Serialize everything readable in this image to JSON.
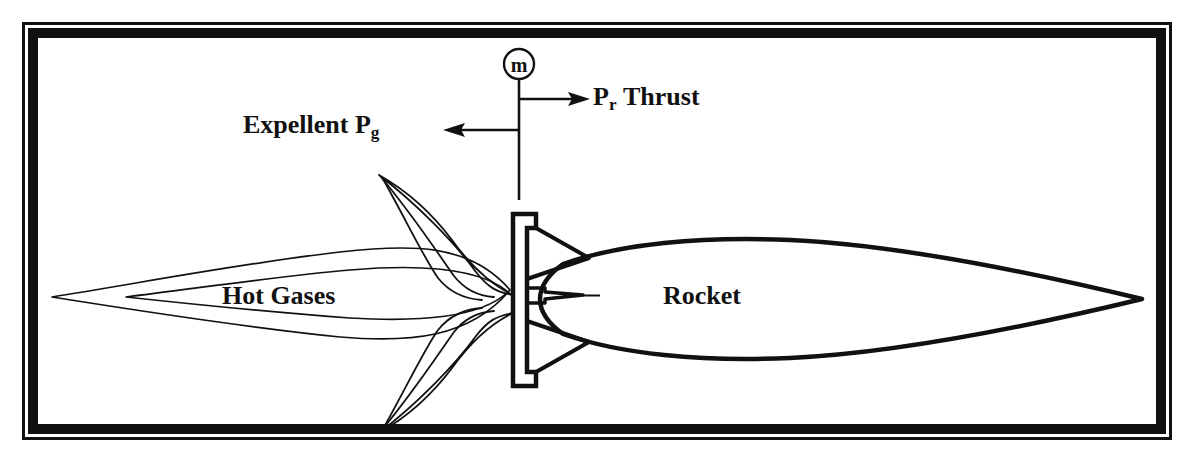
{
  "figure": {
    "background_color": "#ffffff",
    "ink_color": "#111111",
    "frame": {
      "outer_line_color": "#111111",
      "inner_band_color": "#111111",
      "x": 22,
      "y": 22,
      "width": 1150,
      "height": 418
    }
  },
  "labels": {
    "mass_flow_symbol": "m",
    "mass_flow_name": "mass-flow-rate",
    "expellent_text": "Expellent P",
    "expellent_subscript": "g",
    "thrust_text": "P",
    "thrust_subscript": "r",
    "thrust_word": "Thrust",
    "hot_gases": "Hot Gases",
    "rocket": "Rocket"
  },
  "arrows": {
    "thrust_direction": "right",
    "expellent_direction": "left"
  },
  "parts": {
    "control_volume_boundary": "vertical-line",
    "nozzle_plate": "bulkhead-plate",
    "plume": "hot-gas-plume",
    "body": "rocket-body",
    "flames": "flame-streaks"
  }
}
